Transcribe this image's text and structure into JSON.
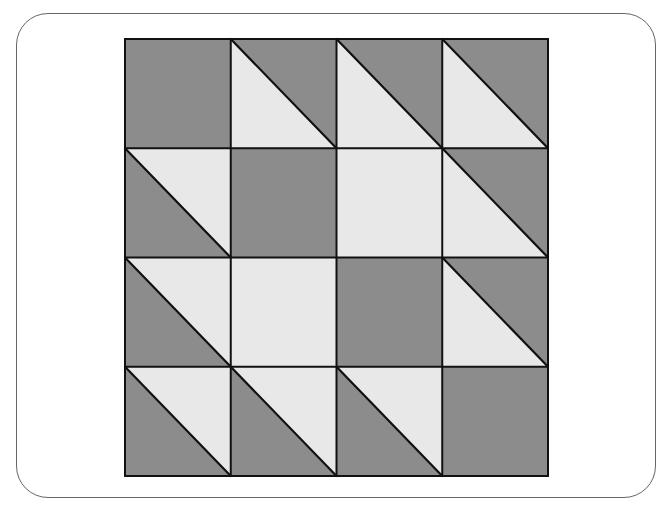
{
  "diagram": {
    "title": "",
    "type": "quilt-block-grid",
    "rows": 4,
    "cols": 4,
    "colors": {
      "dark": "#8c8c8c",
      "light": "#e8e8e8",
      "stroke": "#111111"
    },
    "grid_bounds": {
      "x0": 125,
      "y0": 39,
      "x1": 548,
      "y1": 476
    },
    "cells": [
      [
        "dark",
        "split",
        "split",
        "split"
      ],
      [
        "split-inv",
        "dark",
        "light",
        "split"
      ],
      [
        "split-inv",
        "light",
        "dark",
        "split"
      ],
      [
        "split-inv",
        "split-inv",
        "split-inv",
        "dark"
      ]
    ],
    "legend": {
      "dark": "solid dark square",
      "light": "solid light square",
      "split": "diagonal TL→BR; upper-right dark, lower-left light",
      "split-inv": "diagonal TL→BR; upper-right light, lower-left dark"
    }
  }
}
